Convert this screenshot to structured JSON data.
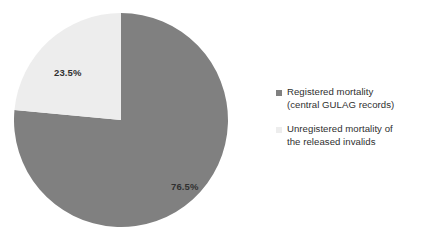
{
  "chart_data": {
    "type": "pie",
    "title": "",
    "categories": [
      "Registered mortality (central GULAG records)",
      "Unregistered mortality of the released invalids"
    ],
    "values": [
      76.5,
      23.5
    ],
    "value_labels": [
      "76.5%",
      "23.5%"
    ],
    "units": "percent",
    "total": 100,
    "start_angle_deg": 0,
    "direction": "clockwise",
    "colors": [
      "#808080",
      "#ededed"
    ],
    "legend_position": "right",
    "grid": false,
    "xlabel": "",
    "ylabel": "",
    "slices": [
      {
        "name": "Registered mortality (central GULAG records)",
        "value": 76.5,
        "label": "76.5%",
        "color": "#808080",
        "sweep_deg": 275.4
      },
      {
        "name": "Unregistered mortality of the released invalids",
        "value": 23.5,
        "label": "23.5%",
        "color": "#ededed",
        "sweep_deg": 84.6
      }
    ]
  },
  "pie": {
    "label_light": "23.5%",
    "label_dark": "76.5%"
  },
  "legend": {
    "entries": [
      {
        "color": "#808080",
        "line1": "Registered mortality",
        "line2": "(central GULAG records)"
      },
      {
        "color": "#ededed",
        "line1": "Unregistered mortality of",
        "line2": "the released invalids"
      }
    ]
  },
  "colors": {
    "registered": "#808080",
    "unregistered": "#ededed",
    "text": "#2f2f2f",
    "background": "#ffffff"
  }
}
